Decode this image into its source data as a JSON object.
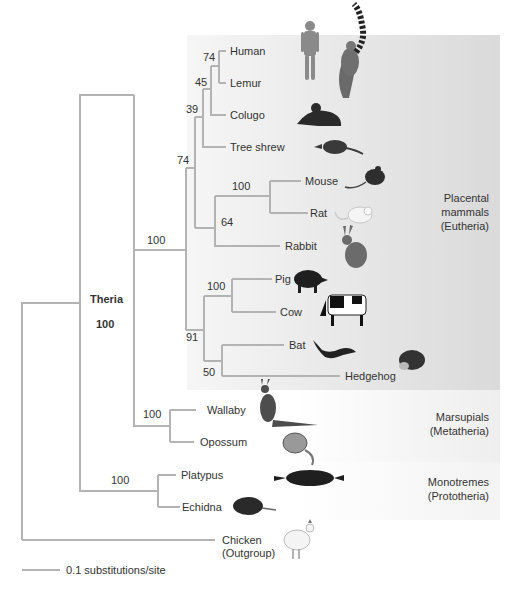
{
  "colors": {
    "branch": "#b3b3b3",
    "eutheria_band_start": "#f4f4f4",
    "eutheria_band_end": "#dcdcdc",
    "metatheria_band": "#f1f1f1",
    "prototheria_band": "#f6f6f6",
    "text": "#333333"
  },
  "taxa": [
    {
      "name": "Human",
      "y": 51,
      "x_end": 226
    },
    {
      "name": "Lemur",
      "y": 83,
      "x_end": 226
    },
    {
      "name": "Colugo",
      "y": 115,
      "x_end": 226
    },
    {
      "name": "Tree shrew",
      "y": 147,
      "x_end": 226
    },
    {
      "name": "Mouse",
      "y": 181,
      "x_end": 301
    },
    {
      "name": "Rat",
      "y": 213,
      "x_end": 308
    },
    {
      "name": "Rabbit",
      "y": 246,
      "x_end": 280
    },
    {
      "name": "Pig",
      "y": 279,
      "x_end": 272
    },
    {
      "name": "Cow",
      "y": 312,
      "x_end": 276
    },
    {
      "name": "Bat",
      "y": 345,
      "x_end": 284
    },
    {
      "name": "Hedgehog",
      "y": 376,
      "x_end": 340
    },
    {
      "name": "Wallaby",
      "y": 410,
      "x_end": 196
    },
    {
      "name": "Opossum",
      "y": 442,
      "x_end": 194
    },
    {
      "name": "Platypus",
      "y": 475,
      "x_end": 176
    },
    {
      "name": "Echidna",
      "y": 507,
      "x_end": 180
    },
    {
      "name": "Chicken",
      "y": 540,
      "x_end": 215,
      "sub": "(Outgroup)"
    }
  ],
  "support_values": [
    {
      "value": "74",
      "x": 208,
      "y": 61
    },
    {
      "value": "45",
      "x": 199,
      "y": 86
    },
    {
      "value": "39",
      "x": 191,
      "y": 113
    },
    {
      "value": "74",
      "x": 182,
      "y": 164
    },
    {
      "value": "100",
      "x": 233,
      "y": 191
    },
    {
      "value": "64",
      "x": 222,
      "y": 226
    },
    {
      "value": "100",
      "x": 147,
      "y": 244
    },
    {
      "value": "100",
      "x": 207,
      "y": 291
    },
    {
      "value": "91",
      "x": 187,
      "y": 341
    },
    {
      "value": "50",
      "x": 203,
      "y": 376
    },
    {
      "value": "100",
      "x": 105,
      "y": 329
    },
    {
      "value": "100",
      "x": 144,
      "y": 418
    },
    {
      "value": "100",
      "x": 112,
      "y": 484
    }
  ],
  "clade_labels": {
    "theria": "Theria",
    "eutheria": [
      "Placental",
      "mammals",
      "(Eutheria)"
    ],
    "metatheria": [
      "Marsupials",
      "(Metatheria)"
    ],
    "prototheria": [
      "Monotremes",
      "(Prototheria)"
    ]
  },
  "scale_bar": {
    "label": "0.1 substitutions/site",
    "x1": 22,
    "x2": 60,
    "y": 570
  },
  "icons": [
    "human-figure",
    "lemur",
    "colugo",
    "tree-shrew",
    "mouse",
    "rat",
    "rabbit",
    "pig",
    "cow",
    "bat",
    "hedgehog",
    "wallaby",
    "opossum",
    "platypus",
    "echidna",
    "chicken"
  ]
}
